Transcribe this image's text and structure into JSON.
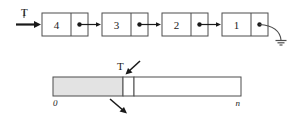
{
  "figure": {
    "name": "linked-list-and-array-representation",
    "colors": {
      "stroke": "#4d4d4d",
      "text": "#1a1a1a",
      "shaded_fill": "#e3e3e3",
      "empty_fill": "#ffffff",
      "background": "#ffffff"
    }
  },
  "linked_list": {
    "head_pointer_label": "T",
    "head_arrow_icon": "right-arrow-icon",
    "nodes": [
      {
        "value": "4",
        "pointer_icon": "pointer-dot-icon"
      },
      {
        "value": "3",
        "pointer_icon": "pointer-dot-icon"
      },
      {
        "value": "2",
        "pointer_icon": "pointer-dot-icon"
      },
      {
        "value": "1",
        "pointer_icon": "pointer-dot-icon"
      }
    ],
    "terminator_icon": "ground-null-icon"
  },
  "array": {
    "top_pointer_label": "T",
    "top_arrow_icon": "down-left-arrow-icon",
    "bottom_arrow_icon": "down-right-arrow-icon",
    "left_index_label": "0",
    "right_index_label": "n",
    "shaded_region_name": "occupied-region",
    "current_cell_name": "top-of-stack-cell",
    "empty_region_name": "free-region"
  }
}
